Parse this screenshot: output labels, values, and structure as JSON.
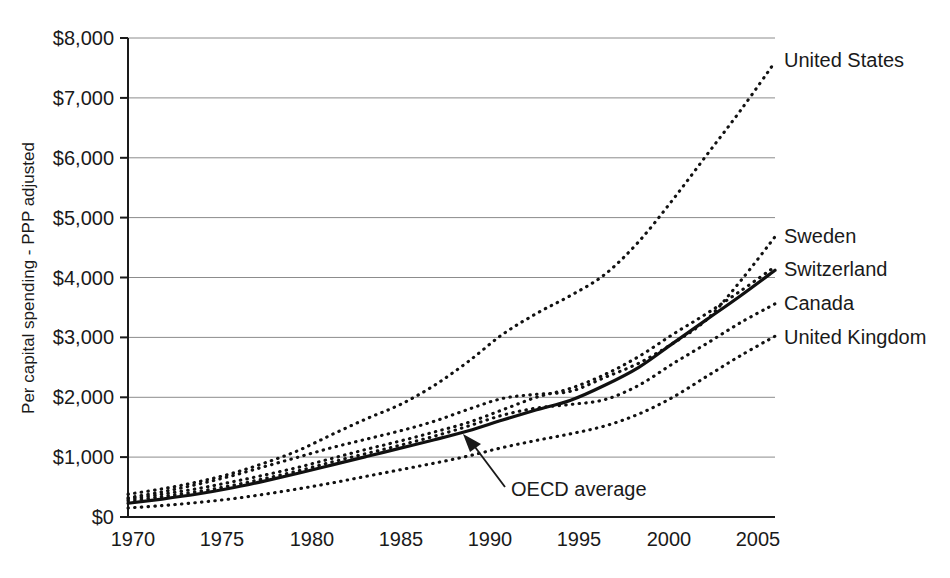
{
  "chart_data": {
    "type": "line",
    "title": "",
    "subtitle": "",
    "xlabel": "",
    "ylabel": "Per capital spending - PPP adjusted",
    "xlim": [
      1970,
      2008
    ],
    "ylim": [
      0,
      8000
    ],
    "grid": true,
    "legend_position": "right-of-plot-at-line-ends",
    "y_tick_labels": [
      "$8,000",
      "$7,000",
      "$6,000",
      "$5,000",
      "$4,000",
      "$3,000",
      "$2,000",
      "$1,000",
      "$0"
    ],
    "y_tick_values": [
      8000,
      7000,
      6000,
      5000,
      4000,
      3000,
      2000,
      1000,
      0
    ],
    "x_tick_labels": [
      "1970",
      "1975",
      "1980",
      "1985",
      "1990",
      "1995",
      "2000",
      "2005"
    ],
    "x_tick_values": [
      1970,
      1975,
      1980,
      1985,
      1990,
      1995,
      2000,
      2005
    ],
    "x": [
      1970,
      1972,
      1974,
      1976,
      1978,
      1980,
      1982,
      1984,
      1986,
      1988,
      1990,
      1992,
      1994,
      1996,
      1998,
      2000,
      2002,
      2004,
      2006,
      2008
    ],
    "series": [
      {
        "name": "United States",
        "style": "dotted",
        "label_value": "United States",
        "values": [
          380,
          470,
          580,
          720,
          900,
          1110,
          1380,
          1640,
          1880,
          2200,
          2600,
          3050,
          3400,
          3700,
          4050,
          4600,
          5300,
          6050,
          6800,
          7600
        ]
      },
      {
        "name": "Sweden",
        "style": "dotted",
        "label_value": "Sweden",
        "values": [
          320,
          420,
          540,
          680,
          840,
          1000,
          1160,
          1300,
          1440,
          1600,
          1800,
          1980,
          2050,
          2100,
          2330,
          2570,
          2900,
          3300,
          3950,
          4680
        ]
      },
      {
        "name": "Switzerland",
        "style": "dotted",
        "label_value": "Switzerland",
        "values": [
          300,
          380,
          470,
          580,
          700,
          830,
          980,
          1130,
          1270,
          1420,
          1580,
          1790,
          2000,
          2150,
          2380,
          2680,
          3050,
          3400,
          3780,
          4180
        ]
      },
      {
        "name": "Canada",
        "style": "dotted",
        "label_value": "Canada",
        "values": [
          270,
          340,
          420,
          520,
          640,
          770,
          920,
          1060,
          1200,
          1350,
          1520,
          1700,
          1820,
          1880,
          1960,
          2200,
          2560,
          2900,
          3250,
          3560
        ]
      },
      {
        "name": "United Kingdom",
        "style": "dotted",
        "label_value": "United Kingdom",
        "values": [
          150,
          190,
          240,
          300,
          380,
          470,
          570,
          680,
          790,
          900,
          1020,
          1160,
          1280,
          1390,
          1520,
          1720,
          2000,
          2350,
          2700,
          3020
        ]
      },
      {
        "name": "OECD average",
        "style": "solid",
        "label_value": "OECD average",
        "values": [
          230,
          300,
          380,
          480,
          600,
          730,
          870,
          1010,
          1150,
          1290,
          1440,
          1620,
          1790,
          1950,
          2200,
          2500,
          2900,
          3300,
          3700,
          4120
        ]
      }
    ],
    "annotations": [
      {
        "text": "OECD average",
        "target_series": "OECD average",
        "target_x": 1990,
        "target_y": 1440
      }
    ]
  },
  "series_labels": {
    "united_states": "United States",
    "sweden": "Sweden",
    "switzerland": "Switzerland",
    "canada": "Canada",
    "united_kingdom": "United Kingdom"
  },
  "annotation": {
    "oecd_average": "OECD average"
  },
  "axes": {
    "y_title": "Per capital spending - PPP adjusted",
    "y_ticks": {
      "t8000": "$8,000",
      "t7000": "$7,000",
      "t6000": "$6,000",
      "t5000": "$5,000",
      "t4000": "$4,000",
      "t3000": "$3,000",
      "t2000": "$2,000",
      "t1000": "$1,000",
      "t0": "$0"
    },
    "x_ticks": {
      "t1970": "1970",
      "t1975": "1975",
      "t1980": "1980",
      "t1985": "1985",
      "t1990": "1990",
      "t1995": "1995",
      "t2000": "2000",
      "t2005": "2005"
    }
  },
  "colors": {
    "line": "#111111",
    "grid": "#8c8c8c",
    "axis": "#1a1a1a",
    "background": "#ffffff"
  }
}
